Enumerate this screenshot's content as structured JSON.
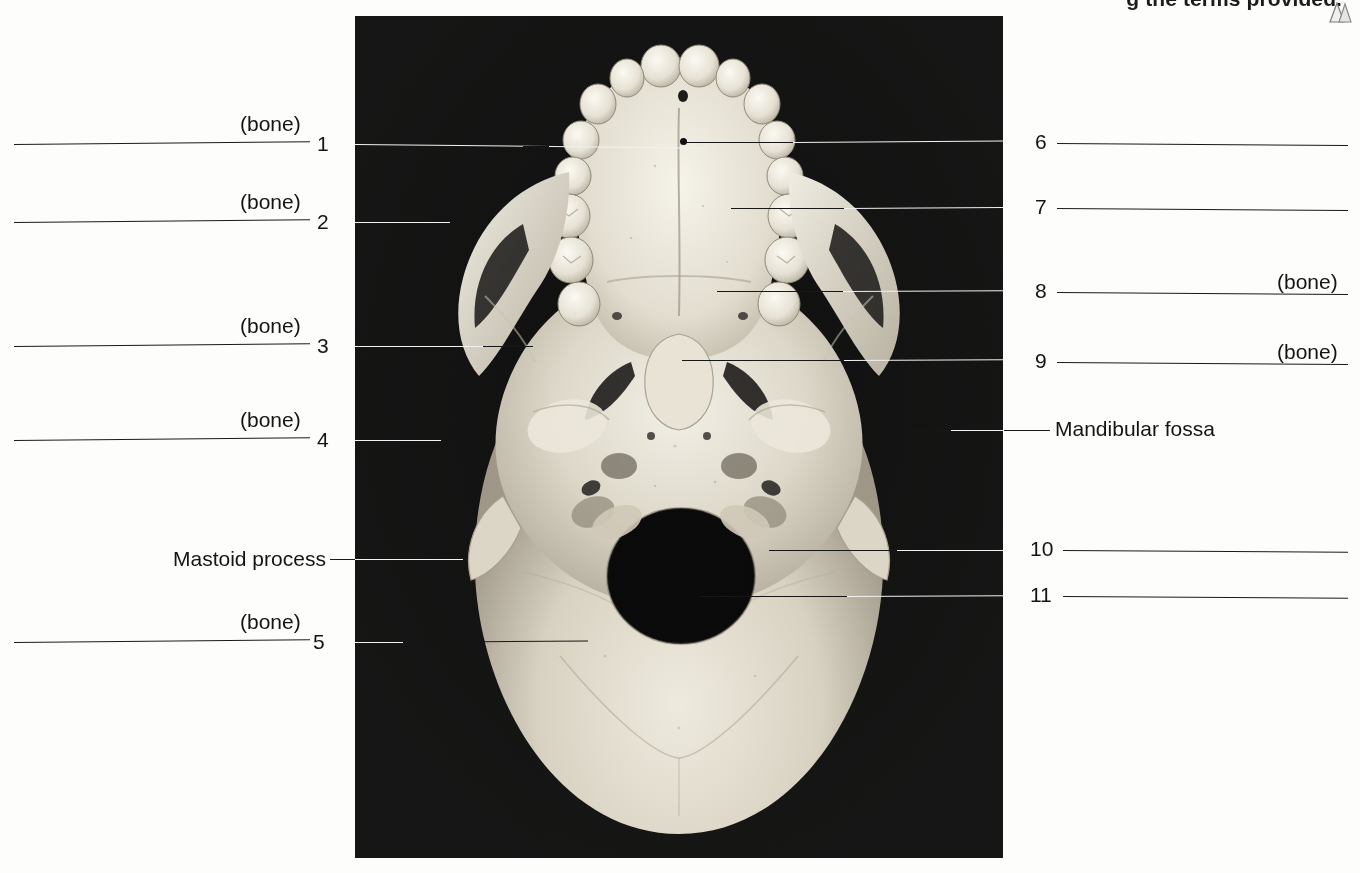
{
  "page": {
    "top_instruction": "g the terms provided.",
    "top_icon": "triangle-bookmark-icon",
    "figure_caption": "",
    "bone_label": "(bone)"
  },
  "figure": {
    "name": "skull-inferior-view-photograph"
  },
  "left_labels": [
    {
      "number": "1",
      "suffix": "(bone)",
      "has_suffix": true
    },
    {
      "number": "2",
      "suffix": "(bone)",
      "has_suffix": true
    },
    {
      "number": "3",
      "suffix": "(bone)",
      "has_suffix": true
    },
    {
      "number": "4",
      "suffix": "(bone)",
      "has_suffix": true
    },
    {
      "number": "5",
      "suffix": "(bone)",
      "has_suffix": true
    }
  ],
  "left_named": [
    {
      "text": "Mastoid process"
    }
  ],
  "right_labels": [
    {
      "number": "6",
      "suffix": "",
      "has_suffix": false
    },
    {
      "number": "7",
      "suffix": "",
      "has_suffix": false
    },
    {
      "number": "8",
      "suffix": "(bone)",
      "has_suffix": true
    },
    {
      "number": "9",
      "suffix": "(bone)",
      "has_suffix": true
    },
    {
      "number": "10",
      "suffix": "",
      "has_suffix": false
    },
    {
      "number": "11",
      "suffix": "",
      "has_suffix": false
    }
  ],
  "right_named": [
    {
      "text": "Mandibular fossa"
    }
  ],
  "colors": {
    "ink": "#141414",
    "leader_light": "#f2f2f2",
    "photo_background": "#090909",
    "page_background": "#fdfdfb"
  }
}
